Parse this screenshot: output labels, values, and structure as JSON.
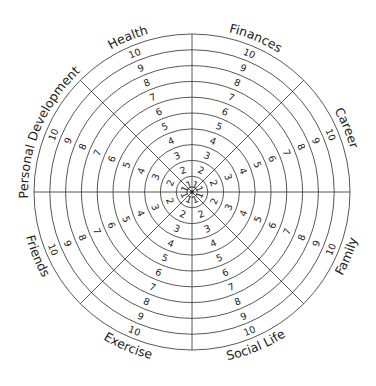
{
  "diagram": {
    "center": [
      192,
      192
    ],
    "ring_count": 10,
    "ring_spacing": 15.8,
    "stroke_color": "#444444",
    "text_color": "#222222",
    "scale_labels": [
      "1",
      "2",
      "3",
      "4",
      "5",
      "6",
      "7",
      "8",
      "9",
      "10"
    ],
    "segments": [
      {
        "name": "Finances",
        "angle": 22.5
      },
      {
        "name": "Career",
        "angle": 67.5
      },
      {
        "name": "Family",
        "angle": 112.5
      },
      {
        "name": "Social Life",
        "angle": 157.5
      },
      {
        "name": "Exercise",
        "angle": 202.5
      },
      {
        "name": "Friends",
        "angle": 247.5
      },
      {
        "name": "Personal Development",
        "angle": 292.5
      },
      {
        "name": "Health",
        "angle": 337.5
      }
    ]
  }
}
